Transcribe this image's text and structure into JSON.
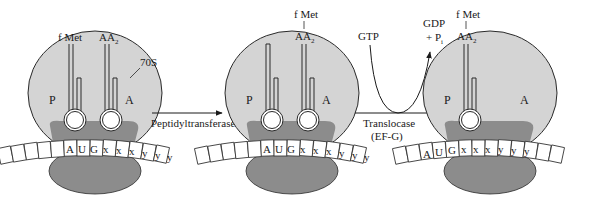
{
  "colors": {
    "large_subunit": "#d4d4d4",
    "band": "#8c8c8c",
    "small_subunit": "#8c8c8c",
    "stroke": "#2a2a2a",
    "background": "#ffffff"
  },
  "panels": [
    {
      "id": "initial",
      "site_p": "P",
      "site_a": "A",
      "label_70s": "70S",
      "trna_labels": [
        "f Met",
        "AA",
        "2"
      ],
      "codons": [
        "A",
        "U",
        "G",
        "x",
        "x",
        "x",
        "y",
        "y",
        "y"
      ]
    },
    {
      "id": "after-peptidyl-transfer",
      "site_p": "P",
      "site_a": "A",
      "dipeptide_top": "f Met",
      "dipeptide_bar": "|",
      "dipeptide_bottom": "AA",
      "dipeptide_sub": "2",
      "codons": [
        "A",
        "U",
        "G",
        "x",
        "x",
        "x",
        "y",
        "y",
        "y"
      ]
    },
    {
      "id": "after-translocation",
      "site_p": "P",
      "site_a": "A",
      "dipeptide_top": "f Met",
      "dipeptide_bar": "|",
      "dipeptide_bottom": "AA",
      "dipeptide_sub": "2",
      "codons": [
        "A",
        "U",
        "G",
        "x",
        "x",
        "x",
        "y",
        "y",
        "y"
      ]
    }
  ],
  "arrows": {
    "step1": "Peptidyltransferase",
    "step2_line1": "Translocase",
    "step2_line2": "(EF-G)",
    "gtp": "GTP",
    "gdp": "GDP",
    "pi": "+ P",
    "pi_sub": "i"
  }
}
